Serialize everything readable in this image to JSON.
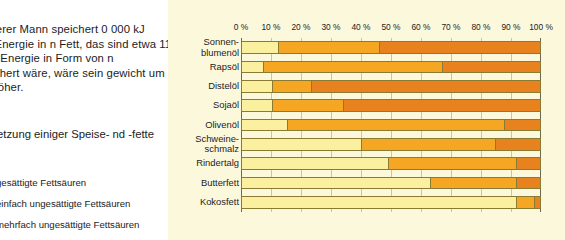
{
  "article": {
    "paragraph": "g schwerer Mann speichert\n0 000 kJ seiner Energie in\nn Fett, das sind etwa 11 kg.\nese Energie in Form von\nn gespeichert wäre, wäre sein\ngewicht um 55 kg höher.",
    "caption": "mmensetzung einiger Speise-\nnd -fette"
  },
  "legend": {
    "position": "left-below-caption",
    "items": [
      {
        "label": "gesättigte Fettsäuren",
        "color": "#FAF0A0",
        "swatch_name": "saturated-swatch"
      },
      {
        "label": "einfach ungesättigte Fettsäuren",
        "color": "#F5A623",
        "swatch_name": "monounsaturated-swatch"
      },
      {
        "label": "mehrfach ungesättigte Fettsäuren",
        "color": "#E8821E",
        "swatch_name": "polyunsaturated-swatch"
      }
    ]
  },
  "chart_data": {
    "type": "bar",
    "orientation": "horizontal",
    "stacked": true,
    "normalized": true,
    "title": "",
    "xlabel": "",
    "ylabel": "",
    "xlim": [
      0,
      100
    ],
    "grid": true,
    "axis_tick_labels": [
      "0 %",
      "10 %",
      "20 %",
      "30 %",
      "40 %",
      "50 %",
      "60 %",
      "70 %",
      "80 %",
      "90 %",
      "100 %"
    ],
    "axis_tick_values": [
      0,
      10,
      20,
      30,
      40,
      50,
      60,
      70,
      80,
      90,
      100
    ],
    "categories": [
      "Sonnen-\nblumenöl",
      "Rapsöl",
      "Distelöl",
      "Sojaöl",
      "Olivenöl",
      "Schweine-\nschmalz",
      "Rindertalg",
      "Butterfett",
      "Kokosfett"
    ],
    "series": [
      {
        "name": "gesättigte Fettsäuren",
        "color": "#FAF0A0",
        "values": [
          12,
          7,
          10,
          10,
          15,
          40,
          49,
          63,
          92
        ]
      },
      {
        "name": "einfach ungesättigte Fettsäuren",
        "color": "#F5A623",
        "values": [
          34,
          60,
          13,
          24,
          73,
          45,
          43,
          29,
          6
        ]
      },
      {
        "name": "mehrfach ungesättigte Fettsäuren",
        "color": "#E8821E",
        "values": [
          54,
          33,
          77,
          66,
          12,
          15,
          8,
          8,
          2
        ]
      }
    ]
  },
  "colors": {
    "panel_background": "#FCF8DC",
    "page_background": "#FDFDF8",
    "gridline": "#C9C5A6",
    "axis": "#6D6A52",
    "bar_outline": "#8A7A32"
  }
}
